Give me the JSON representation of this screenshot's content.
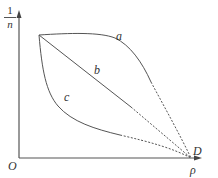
{
  "diagram": {
    "y_axis": {
      "label_numerator": "1",
      "label_denominator": "n"
    },
    "x_axis": {
      "label": "ρ"
    },
    "origin_label": "O",
    "point_label": "D",
    "curves": [
      {
        "id": "a",
        "label": "a",
        "shape": "concave, above line"
      },
      {
        "id": "b",
        "label": "b",
        "shape": "straight line"
      },
      {
        "id": "c",
        "label": "c",
        "shape": "convex, below line"
      }
    ],
    "colors": {
      "line": "#555555",
      "text": "#333333"
    }
  }
}
